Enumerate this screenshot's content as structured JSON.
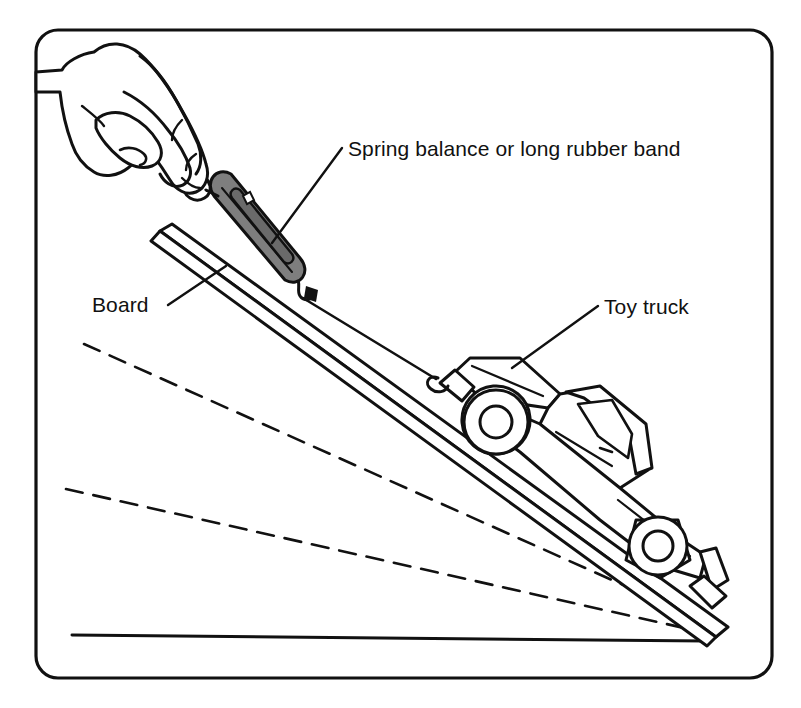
{
  "figure": {
    "kind": "line-art-diagram",
    "title_text": null,
    "background_color": "#ffffff",
    "ink_color": "#111111",
    "frame": {
      "shape": "rounded-rectangle",
      "x": 36,
      "y": 30,
      "width": 736,
      "height": 648,
      "corner_radius": 22,
      "stroke_width": 3.2
    },
    "labels": [
      {
        "id": "spring-balance",
        "text": "Spring balance or long rubber band",
        "text_x": 348,
        "text_y": 156,
        "anchor": "start",
        "leader": {
          "x1": 342,
          "y1": 148,
          "x2": 272,
          "y2": 243
        }
      },
      {
        "id": "board",
        "text": "Board",
        "text_x": 92,
        "text_y": 312,
        "anchor": "start",
        "leader": {
          "x1": 168,
          "y1": 305,
          "x2": 226,
          "y2": 266
        }
      },
      {
        "id": "toy-truck",
        "text": "Toy truck",
        "text_x": 604,
        "text_y": 314,
        "anchor": "start",
        "leader": {
          "x1": 598,
          "y1": 306,
          "x2": 512,
          "y2": 368
        }
      }
    ],
    "parts": [
      {
        "name": "hand",
        "description": "hand gripping the ring of the spring balance"
      },
      {
        "name": "spring-balance",
        "description": "gray elongated capsule scale with window slot and pointer",
        "fill_color": "#7e7e7e"
      },
      {
        "name": "string",
        "description": "line from spring balance hook to truck bumper hook"
      },
      {
        "name": "board",
        "description": "inclined plank, drawn as a long parallelogram"
      },
      {
        "name": "toy-truck",
        "description": "pickup truck outline sitting on the incline"
      },
      {
        "name": "ground-line",
        "description": "horizontal baseline at the bottom"
      },
      {
        "name": "angle-guide-upper",
        "description": "dashed line showing a shallower board angle"
      },
      {
        "name": "angle-guide-lower",
        "description": "dashed line showing the shallowest board angle"
      }
    ],
    "geometry": {
      "pivot_x": 716,
      "pivot_y": 637,
      "ground_line": {
        "x1": 72,
        "y1": 635,
        "x2": 706,
        "y2": 641
      },
      "board_top_x": 160,
      "board_top_y": 231,
      "dashed_upper": {
        "x1": 84,
        "y1": 344,
        "x2": 706,
        "y2": 622
      },
      "dashed_lower": {
        "x1": 66,
        "y1": 489,
        "x2": 702,
        "y2": 632
      }
    }
  }
}
